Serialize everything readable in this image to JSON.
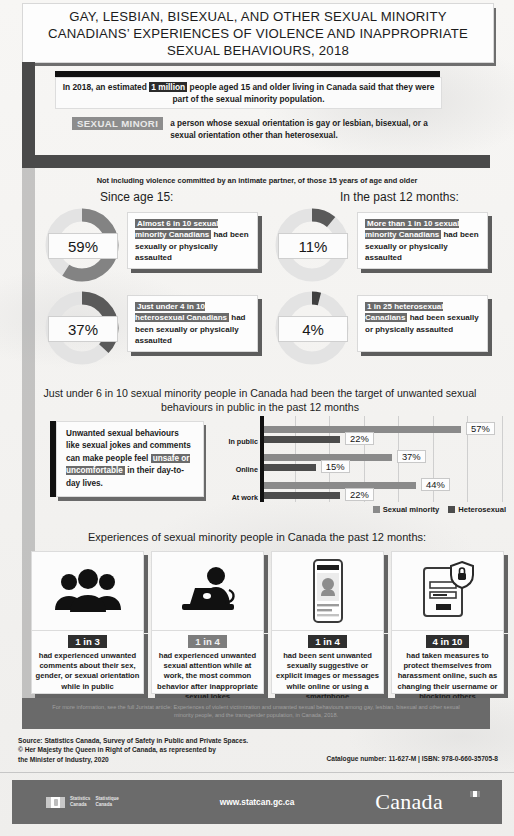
{
  "title": "GAY, LESBIAN, BISEXUAL, AND OTHER SEXUAL MINORITY CANADIANS’ EXPERIENCES OF VIOLENCE AND INAPPROPRIATE SEXUAL BEHAVIOURS, 2018",
  "intro": {
    "before": "In 2018, an estimated ",
    "highlight": "1 million",
    "after": " people aged 15 and older living in Canada said that they were part of the sexual minority population."
  },
  "definition": {
    "term": "SEXUAL MINORI",
    "text": "a person whose sexual orientation is gay or lesbian, bisexual, or a sexual orientation other than heterosexual."
  },
  "assault_section": {
    "note": "Not including violence committed by an intimate partner, of those 15 years of age and older",
    "column_headings": [
      "Since age 15:",
      "In the past 12 months:"
    ],
    "donuts": [
      {
        "value": "59%",
        "pct": 59,
        "callout_highlight": "Almost 6 in 10 sexual minority Canadians",
        "callout_rest": "had been sexually or physically assaulted"
      },
      {
        "value": "11%",
        "pct": 11,
        "callout_highlight": "More than 1 in 10 sexual minority Canadians",
        "callout_rest": "had been sexually or physically assaulted"
      },
      {
        "value": "37%",
        "pct": 37,
        "callout_highlight": "Just under 4 in 10 heterosexual Canadians",
        "callout_rest": "had been sexually or physically assaulted"
      },
      {
        "value": "4%",
        "pct": 4,
        "callout_highlight": "1 in 25 heterosexual Canadians",
        "callout_rest": " had been sexually or physically assaulted"
      }
    ]
  },
  "quote": {
    "lead": "Unwanted sexual behaviours like sexual jokes and comments can make people feel ",
    "highlight": "unsafe or uncomfortable",
    "tail": " in their day-to-day lives."
  },
  "chart_data": {
    "type": "bar",
    "title": "Just under 6 in 10 sexual minority people in Canada had been the target of unwanted sexual behaviours in public in the past 12 months",
    "orientation": "horizontal",
    "categories": [
      "In public",
      "Online",
      "At work"
    ],
    "series": [
      {
        "name": "Sexual minority",
        "values": [
          57,
          37,
          44
        ],
        "color": "#8a8a8a"
      },
      {
        "name": "Heterosexual",
        "values": [
          22,
          15,
          22
        ],
        "color": "#4c4c4c"
      }
    ],
    "value_labels": [
      "57%",
      "22%",
      "37%",
      "15%",
      "44%",
      "22%"
    ],
    "xlim": [
      0,
      70
    ],
    "xlabel": "",
    "ylabel": "",
    "grid": true,
    "gridlines_at": [
      10,
      20,
      30,
      40,
      50,
      60,
      70
    ],
    "legend_position": "bottom-right"
  },
  "cards_section": {
    "heading": "Experiences of sexual minority people in Canada the past 12 months:",
    "cards": [
      {
        "icon": "group-of-people-icon",
        "ratio": "1 in 3",
        "ratio_style": "dark",
        "text": "had experienced unwanted comments about their sex, gender, or sexual orientation while in public"
      },
      {
        "icon": "person-at-laptop-icon",
        "ratio": "1 in 4",
        "ratio_style": "grey",
        "text": "had experienced unwanted sexual attention while at work, the most common behavior after inappropriate sexual jokes"
      },
      {
        "icon": "smartphone-message-icon",
        "ratio": "1 in 4",
        "ratio_style": "dark",
        "text": "had been sent unwanted sexually suggestive or explicit images or messages while online or using a smartphone"
      },
      {
        "icon": "login-shield-lock-icon",
        "ratio": "4 in 10",
        "ratio_style": "dark",
        "text": "had taken measures to protect themselves from harassment online, such as changing their username or blocking others"
      }
    ]
  },
  "footer": {
    "more_info": "For more information, see the full Juristat article: Experiences of violent victimization and unwanted sexual behaviours among gay, lesbian, bisexual and other sexual minority people, and the transgender population, in Canada, 2018.",
    "source_lines": [
      "Source: Statistics Canada, Survey of Safety in Public and Private Spaces.",
      "© Her Majesty the Queen in Right of Canada, as represented by",
      "the Minister of Industry, 2020"
    ],
    "catalogue": "Catalogue number: 11-627-M  |  ISBN: 978-0-660-35705-8",
    "wordmark_en": "Statistics",
    "wordmark_en2": "Canada",
    "wordmark_fr": "Statistique",
    "wordmark_fr2": "Canada",
    "website": "www.statcan.gc.ca",
    "canada_wordmark": "Canada"
  }
}
